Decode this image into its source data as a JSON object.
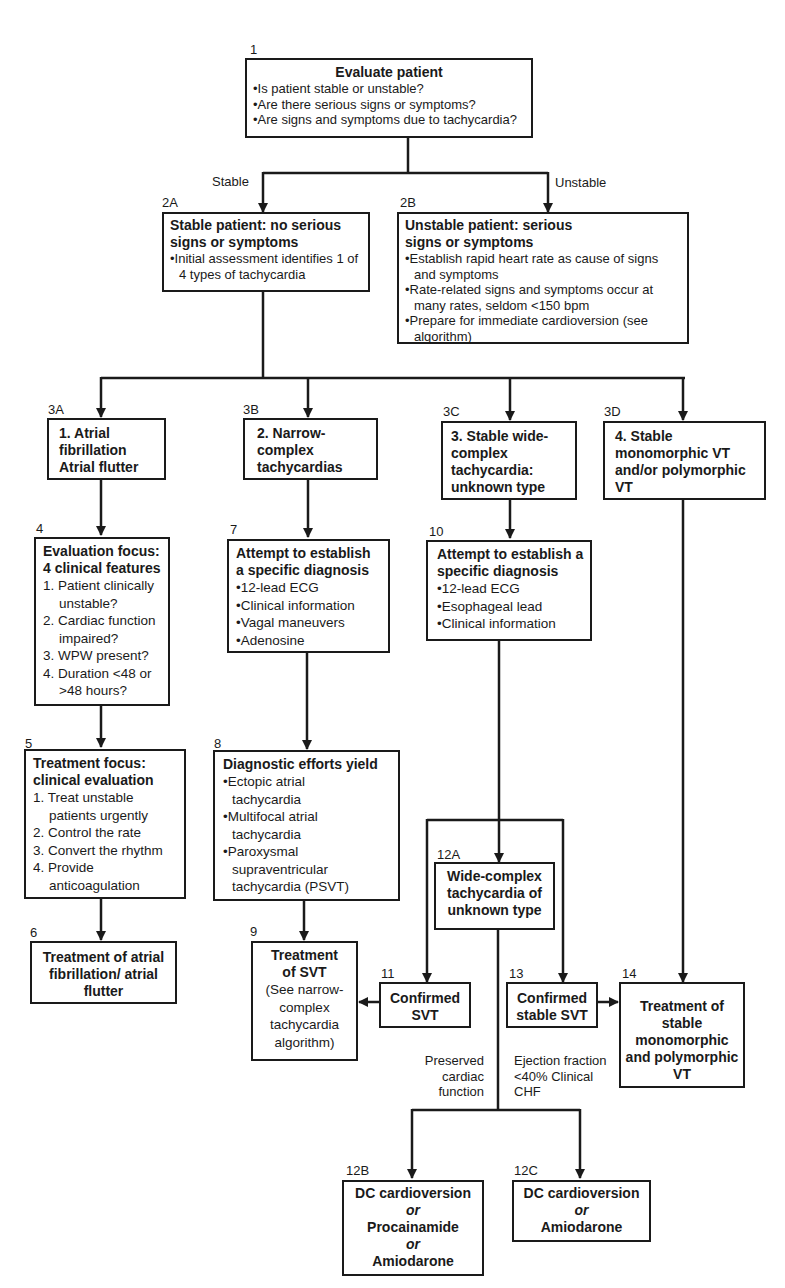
{
  "diagram": {
    "type": "clinical-algorithm-flowchart",
    "colors": {
      "stroke": "#1a1a1a",
      "background": "#ffffff"
    },
    "nodes": {
      "n1": {
        "id": "1",
        "title": "Evaluate patient",
        "items": [
          "Is patient stable or unstable?",
          "Are there serious signs or symptoms?",
          "Are signs and symptoms due to tachycardia?"
        ]
      },
      "n2a": {
        "id": "2A",
        "title": "Stable patient: no serious signs or symptoms",
        "items": [
          "Initial assessment identifies 1 of 4 types of tachycardia"
        ]
      },
      "n2b": {
        "id": "2B",
        "title": "Unstable patient: serious signs or symptoms",
        "items": [
          "Establish rapid heart rate as cause of signs and symptoms",
          "Rate-related signs and symptoms occur at many rates, seldom <150 bpm",
          "Prepare for immediate cardioversion (see algorithm)"
        ]
      },
      "n3a": {
        "id": "3A",
        "title": "1. Atrial fibrillation Atrial flutter"
      },
      "n3b": {
        "id": "3B",
        "title": "2. Narrow-complex tachycardias"
      },
      "n3c": {
        "id": "3C",
        "title": "3. Stable wide-complex tachycardia: unknown type"
      },
      "n3d": {
        "id": "3D",
        "title": "4. Stable monomorphic VT and/or polymorphic VT"
      },
      "n4": {
        "id": "4",
        "title": "Evaluation focus: 4 clinical features",
        "items": [
          "1. Patient clinically unstable?",
          "2. Cardiac function impaired?",
          "3. WPW present?",
          "4. Duration <48 or >48 hours?"
        ]
      },
      "n5": {
        "id": "5",
        "title": "Treatment focus: clinical evaluation",
        "items": [
          "1. Treat unstable patients urgently",
          "2. Control the rate",
          "3. Convert the rhythm",
          "4. Provide anticoagulation"
        ]
      },
      "n6": {
        "id": "6",
        "title": "Treatment of atrial fibrillation/ atrial flutter"
      },
      "n7": {
        "id": "7",
        "title": "Attempt to establish a specific diagnosis",
        "items": [
          "12-lead ECG",
          "Clinical information",
          "Vagal maneuvers",
          "Adenosine"
        ]
      },
      "n8": {
        "id": "8",
        "title": "Diagnostic efforts yield",
        "items": [
          "Ectopic atrial tachycardia",
          "Multifocal atrial tachycardia",
          "Paroxysmal supraventricular tachycardia (PSVT)"
        ]
      },
      "n9": {
        "id": "9",
        "title": "Treatment of SVT",
        "note": "(See narrow-complex tachycardia algorithm)"
      },
      "n10": {
        "id": "10",
        "title": "Attempt to establish a specific diagnosis",
        "items": [
          "12-lead ECG",
          "Esophageal lead",
          "Clinical information"
        ]
      },
      "n11": {
        "id": "11",
        "title": "Confirmed SVT"
      },
      "n12a": {
        "id": "12A",
        "title": "Wide-complex tachycardia of unknown type"
      },
      "n12b": {
        "id": "12B",
        "lines": [
          "DC cardioversion",
          "or",
          "Procainamide",
          "or",
          "Amiodarone"
        ]
      },
      "n12c": {
        "id": "12C",
        "lines": [
          "DC cardioversion",
          "or",
          "Amiodarone"
        ]
      },
      "n13": {
        "id": "13",
        "title": "Confirmed stable SVT"
      },
      "n14": {
        "id": "14",
        "title": "Treatment of stable monomorphic and polymorphic VT"
      }
    },
    "branch_labels": {
      "stable": "Stable",
      "unstable": "Unstable",
      "preserved": "Preserved cardiac function",
      "ejection": "Ejection fraction <40% Clinical CHF"
    }
  }
}
